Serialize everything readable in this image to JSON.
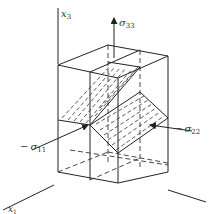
{
  "figure": {
    "type": "stress element cube with inclined shaded planes",
    "axes": {
      "x3": {
        "label": "x",
        "sub": "3"
      },
      "x1": {
        "label": "x",
        "sub": "1"
      },
      "x2": {
        "label": "",
        "sub": ""
      }
    },
    "stresses": {
      "s33": {
        "sign": "",
        "symbol": "σ",
        "sub": "33"
      },
      "s11": {
        "sign": "−",
        "symbol": "σ",
        "sub": "11"
      },
      "s22": {
        "sign": "−",
        "symbol": "σ",
        "sub": "22"
      }
    },
    "colors": {
      "line": "#222222",
      "background": "#ffffff"
    }
  }
}
